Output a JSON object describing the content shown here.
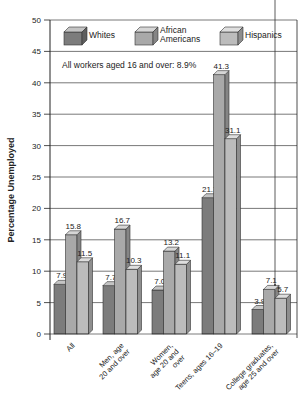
{
  "chart_data": {
    "type": "bar",
    "title": "",
    "xlabel": "",
    "ylabel": "Percentage Unemployed",
    "ylim": [
      0,
      50
    ],
    "yticks": [
      0,
      5,
      10,
      15,
      20,
      25,
      30,
      35,
      40,
      45,
      50
    ],
    "grid": true,
    "legend_position": "top-inside",
    "annotation": "All workers aged 16 and over: 8.9%",
    "categories": [
      "All",
      "Men, age 20 and over",
      "Women, age 20 and over",
      "Teens, ages 16–19",
      "College graduates, age 25 and over"
    ],
    "category_lines": [
      [
        "All"
      ],
      [
        "Men, age",
        "20 and over"
      ],
      [
        "Women,",
        "age 20 and",
        "over"
      ],
      [
        "Teens, ages 16–19"
      ],
      [
        "College graduates,",
        "age 25 and over"
      ]
    ],
    "series": [
      {
        "name": "Whites",
        "values": [
          7.9,
          7.7,
          7.0,
          21.7,
          3.9
        ],
        "color": "#7c7c7c",
        "side": "#5e5e5e",
        "top": "#c4c4c4"
      },
      {
        "name": "African Americans",
        "values": [
          15.8,
          16.7,
          13.2,
          41.3,
          7.1
        ],
        "color": "#a9a9a9",
        "side": "#858585",
        "top": "#d6d6d6"
      },
      {
        "name": "Hispanics",
        "values": [
          11.5,
          10.3,
          11.1,
          31.1,
          5.7
        ],
        "color": "#bcbcbc",
        "side": "#8e8e8e",
        "top": "#dedede"
      }
    ],
    "legend_lines": [
      [
        "Whites"
      ],
      [
        "African",
        "Americans"
      ],
      [
        "Hispanics"
      ]
    ]
  }
}
